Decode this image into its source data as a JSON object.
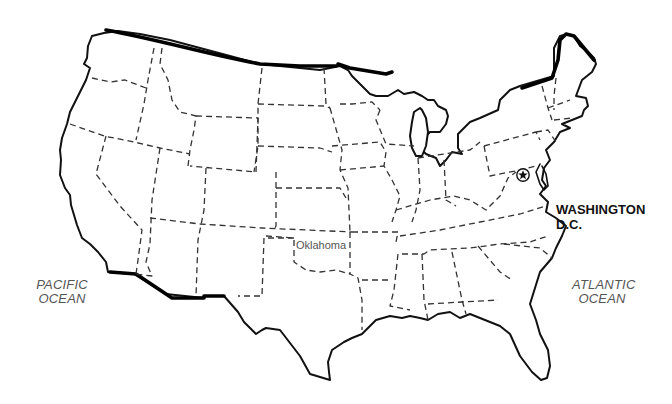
{
  "map": {
    "region": "Contiguous United States",
    "style": "outline map with dashed state boundaries",
    "colors": {
      "background": "#ffffff",
      "outline": "#111111",
      "state_lines": "#333333",
      "label_text": "#555555"
    }
  },
  "oceans": {
    "pacific": {
      "line1": "PACIFIC",
      "line2": "OCEAN"
    },
    "atlantic": {
      "line1": "ATLANTIC",
      "line2": "OCEAN"
    }
  },
  "states": {
    "labeled": [
      {
        "name": "Oklahoma"
      }
    ]
  },
  "capital": {
    "line1": "WASHINGTON",
    "line2": "D.C.",
    "marker_icon": "star-in-circle-icon"
  }
}
